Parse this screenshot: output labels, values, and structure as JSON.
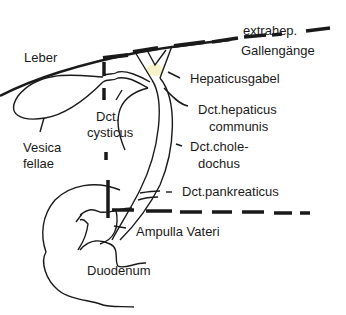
{
  "diagram": {
    "labels": {
      "extrahep_line1": "extrahep.",
      "extrahep_line2": "Gallengänge",
      "leber": "Leber",
      "hepaticusgabel": "Hepaticusgabel",
      "hepaticus_line1": "Dct.hepaticus",
      "hepaticus_line2": "communis",
      "cysticus_line1": "Dct.",
      "cysticus_line2": "cysticus",
      "vesica_line1": "Vesica",
      "vesica_line2": "fellae",
      "choledochus_line1": "Dct.chole-",
      "choledochus_line2": "dochus",
      "pankreaticus": "Dct.pankreaticus",
      "ampulla": "Ampulla Vateri",
      "duodenum": "Duodenum"
    },
    "colors": {
      "ink": "#1a1a1a",
      "highlight": "#f6f3c8",
      "background": "#ffffff"
    }
  }
}
